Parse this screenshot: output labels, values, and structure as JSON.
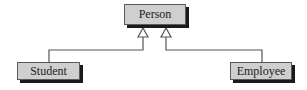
{
  "diagram": {
    "type": "uml-class-inheritance",
    "classes": [
      {
        "id": "person",
        "label": "Person",
        "role": "superclass"
      },
      {
        "id": "student",
        "label": "Student",
        "role": "subclass"
      },
      {
        "id": "employee",
        "label": "Employee",
        "role": "subclass"
      }
    ],
    "relations": [
      {
        "from": "Student",
        "to": "Person",
        "type": "generalization"
      },
      {
        "from": "Employee",
        "to": "Person",
        "type": "generalization"
      }
    ],
    "colors": {
      "box_fill": "#cfcfcf",
      "box_border": "#5a5a5a",
      "shadow": "#1a1a1a",
      "line": "#555555"
    }
  }
}
